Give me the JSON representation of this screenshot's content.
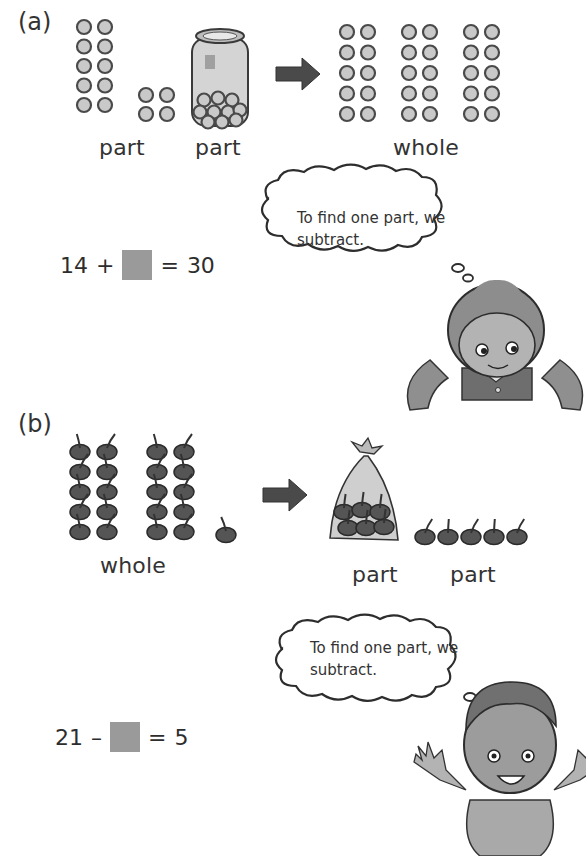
{
  "part_a": {
    "label": "(a)",
    "groups": {
      "left_marbles": {
        "columns": 2,
        "rows": 5,
        "count": 10
      },
      "small_marbles": {
        "columns": 2,
        "rows": 2,
        "count": 4
      },
      "jar": {
        "contents": "marbles"
      },
      "whole_marbles": {
        "blocks": 3,
        "columns_per_block": 2,
        "rows": 5,
        "count": 30
      }
    },
    "captions": {
      "part1": "part",
      "part2": "part",
      "whole": "whole"
    },
    "equation": {
      "left": "14",
      "operator": "+",
      "equals": "=",
      "result": "30"
    },
    "thought": {
      "line1": "To find one part, we",
      "line2": "subtract."
    },
    "character": "girl"
  },
  "part_b": {
    "label": "(b)",
    "groups": {
      "whole_cherries": {
        "blocks": 2,
        "columns_per_block": 2,
        "rows": 5,
        "extra": 1,
        "count": 21
      },
      "bag": {
        "contents": "cherries"
      },
      "loose_cherries": {
        "count": 5
      }
    },
    "captions": {
      "whole": "whole",
      "part1": "part",
      "part2": "part"
    },
    "equation": {
      "left": "21",
      "operator": "–",
      "equals": "=",
      "result": "5"
    },
    "thought": {
      "line1": "To find one part, we",
      "line2": "subtract."
    },
    "character": "boy"
  },
  "colors": {
    "arrow": "#4a4a4a",
    "marble_fill": "#c9c9c9",
    "marble_ring": "#4a4a4a",
    "cherry": "#555555",
    "blank_box": "#9a9a9a",
    "ink": "#2d2d2d"
  }
}
